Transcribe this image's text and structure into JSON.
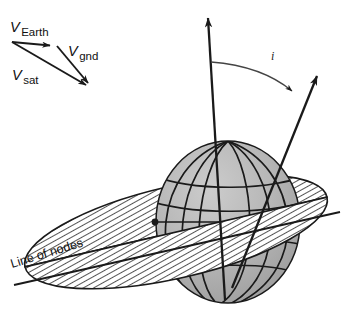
{
  "figure": {
    "background_color": "#ffffff",
    "line_color": "#1a1a1a",
    "sphere_color": "#b2b2b2",
    "sphere_shade_light": "#c8c8c8",
    "sphere_shade_dark": "#9a9a9a",
    "hatch_color": "#1a1a1a"
  },
  "velocity_triangle": {
    "origin_label": "",
    "vectors": [
      {
        "id": "v-earth",
        "symbol": "V",
        "subscript": "Earth",
        "label_x": 10,
        "label_y": 32,
        "from": [
          12,
          42
        ],
        "to": [
          57,
          46
        ]
      },
      {
        "id": "v-gnd",
        "symbol": "V",
        "subscript": "gnd",
        "label_x": 68,
        "label_y": 56,
        "from": [
          57,
          46
        ],
        "to": [
          93,
          89
        ]
      },
      {
        "id": "v-sat",
        "symbol": "V",
        "subscript": "sat",
        "label_x": 12,
        "label_y": 80,
        "from": [
          12,
          42
        ],
        "to": [
          93,
          89
        ]
      }
    ]
  },
  "globe": {
    "center_x": 228,
    "center_y": 222,
    "radius_x": 72,
    "radius_y": 81,
    "equator_label": "",
    "meridian_count": 5,
    "parallel_count": 4,
    "node_point": [
      155,
      222
    ]
  },
  "axes": {
    "rotation_axis": {
      "name": "earth-rotation-axis",
      "from": [
        225,
        300
      ],
      "to": [
        208,
        12
      ]
    },
    "orbit_normal_axis": {
      "name": "orbit-normal-axis",
      "from": [
        232,
        288
      ],
      "to": [
        321,
        69
      ]
    }
  },
  "inclination_angle": {
    "label": "i",
    "label_x": 271,
    "label_y": 60,
    "arc_start": [
      211,
      62
    ],
    "arc_end": [
      296,
      94
    ]
  },
  "line_of_nodes": {
    "label": "Line of nodes",
    "label_x": 12,
    "label_y": 268,
    "rotation_deg": -17,
    "leader_from": [
      14,
      285
    ],
    "leader_to": [
      340,
      212
    ]
  },
  "orbit_plane": {
    "name": "orbital-plane-ellipse",
    "fill": "hatched",
    "center_x": 176,
    "center_y": 232,
    "radius_x": 155,
    "radius_y": 46,
    "tilt_deg": -13
  }
}
